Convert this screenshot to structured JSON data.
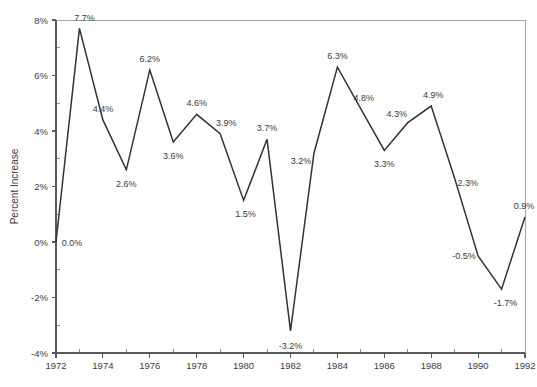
{
  "chart_data": {
    "type": "line",
    "title": "",
    "xlabel": "",
    "ylabel": "Percent Increase",
    "x": [
      1972,
      1973,
      1974,
      1975,
      1976,
      1977,
      1978,
      1979,
      1980,
      1981,
      1982,
      1983,
      1984,
      1985,
      1986,
      1987,
      1988,
      1989,
      1990,
      1991,
      1992
    ],
    "values": [
      0.0,
      7.7,
      4.4,
      2.6,
      6.2,
      3.6,
      4.6,
      3.9,
      1.5,
      3.7,
      -3.2,
      3.2,
      6.3,
      4.8,
      3.3,
      4.3,
      4.9,
      2.3,
      -0.5,
      -1.7,
      0.9
    ],
    "point_labels": [
      "0.0%",
      "7.7%",
      "4.4%",
      "2.6%",
      "6.2%",
      "3.6%",
      "4.6%",
      "3.9%",
      "1.5%",
      "3.7%",
      "-3.2%",
      "3.2%",
      "6.3%",
      "4.8%",
      "3.3%",
      "4.3%",
      "4.9%",
      "2.3%",
      "-0.5%",
      "-1.7%",
      "0.9%"
    ],
    "label_offsets": [
      {
        "dx": 16,
        "dy": 4
      },
      {
        "dx": 5,
        "dy": -7
      },
      {
        "dx": 0,
        "dy": -8
      },
      {
        "dx": 0,
        "dy": 17
      },
      {
        "dx": 0,
        "dy": -8
      },
      {
        "dx": 0,
        "dy": 17
      },
      {
        "dx": 0,
        "dy": -8
      },
      {
        "dx": 6,
        "dy": -8
      },
      {
        "dx": 2,
        "dy": 17
      },
      {
        "dx": 0,
        "dy": -8
      },
      {
        "dx": 0,
        "dy": 18
      },
      {
        "dx": -13,
        "dy": 11
      },
      {
        "dx": 0,
        "dy": -8
      },
      {
        "dx": 3,
        "dy": -8
      },
      {
        "dx": 0,
        "dy": 17
      },
      {
        "dx": -11,
        "dy": -6
      },
      {
        "dx": 2,
        "dy": -8
      },
      {
        "dx": 13,
        "dy": 8
      },
      {
        "dx": -14,
        "dy": 3
      },
      {
        "dx": 4,
        "dy": 17
      },
      {
        "dx": -1,
        "dy": -8
      }
    ],
    "ylim": [
      -4,
      8
    ],
    "xlim": [
      1972,
      1992
    ],
    "y_ticks": [
      8,
      6,
      4,
      2,
      0,
      -2,
      -4
    ],
    "y_tick_labels": [
      "8%",
      "6%",
      "4%",
      "2%",
      "0%",
      "-2%",
      "-4%"
    ],
    "y_minor_step": 1,
    "x_ticks": [
      1972,
      1974,
      1976,
      1978,
      1980,
      1982,
      1984,
      1986,
      1988,
      1990,
      1992
    ],
    "x_tick_labels": [
      "1972",
      "1974",
      "1976",
      "1978",
      "1980",
      "1982",
      "1984",
      "1986",
      "1988",
      "1990",
      "1992"
    ],
    "x_minor_step": 1,
    "grid": false,
    "legend": null,
    "line_color": "#333333",
    "axis_color": "#595959",
    "frame_color": "#a6a6a6",
    "background_color": "#ffffff"
  },
  "plot_geometry": {
    "left": 56,
    "right": 525,
    "top": 20,
    "bottom": 353
  }
}
